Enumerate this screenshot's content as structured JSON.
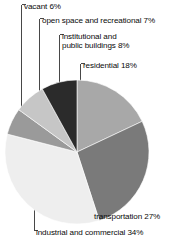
{
  "chart_data": {
    "type": "pie",
    "title": "",
    "subtitle": "",
    "xlabel": "",
    "ylabel": "",
    "legend_position": "none",
    "grid": false,
    "labels_inline": true,
    "units": "percent",
    "total": 100,
    "categories": [
      "residential",
      "transportation",
      "industrial and commercial",
      "vacant",
      "open space and recreational",
      "institutional and public buildings"
    ],
    "values": [
      18,
      27,
      34,
      6,
      7,
      8
    ],
    "colors": [
      "#a8a8a8",
      "#7a7a7a",
      "#eeeeee",
      "#9a9a9a",
      "#c6c6c6",
      "#2b2b2b"
    ],
    "slices": [
      {
        "label": "residential",
        "value": 18,
        "display": "residential 18%",
        "color": "#a8a8a8"
      },
      {
        "label": "transportation",
        "value": 27,
        "display": "transportation 27%",
        "color": "#7a7a7a"
      },
      {
        "label": "industrial and commercial",
        "value": 34,
        "display": "industrial and commercial 34%",
        "color": "#eeeeee"
      },
      {
        "label": "vacant",
        "value": 6,
        "display": "vacant 6%",
        "color": "#9a9a9a"
      },
      {
        "label": "open space and recreational",
        "value": 7,
        "display": "open space and recreational 7%",
        "color": "#c6c6c6"
      },
      {
        "label": "institutional and public buildings",
        "value": 8,
        "display": "institutional and public buildings 8%",
        "color": "#2b2b2b"
      }
    ]
  },
  "labels": {
    "vacant": "vacant 6%",
    "open_space": "open space and recreational 7%",
    "institutional_line1": "institutional and",
    "institutional_line2": "public buildings 8%",
    "residential": "residential 18%",
    "transportation": "transportation 27%",
    "industrial": "industrial and commercial 34%"
  }
}
